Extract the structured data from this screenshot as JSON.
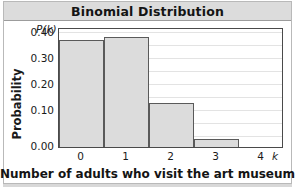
{
  "title": "Binomial Distribution",
  "chart_data": {
    "type": "bar",
    "title": "Binomial Distribution",
    "subtitle": "",
    "xlabel": "Number of adults who visit the art museum",
    "ylabel": "Probability",
    "x_variable_symbol": "k",
    "y_variable_symbol": "P(k)",
    "categories": [
      "0",
      "1",
      "2",
      "3",
      "4"
    ],
    "values": [
      0.41,
      0.42,
      0.17,
      0.03,
      0.0
    ],
    "xlim": [
      -0.5,
      4.5
    ],
    "ylim": [
      0,
      0.46
    ],
    "yticks": [
      "0.40",
      "0.30",
      "0.20",
      "0.10",
      "0.00"
    ],
    "ytick_values": [
      0.4,
      0.3,
      0.2,
      0.1,
      0.0
    ],
    "xticks": [
      "0",
      "1",
      "2",
      "3",
      "4"
    ],
    "grid": true,
    "grid_axis": "y",
    "minor_grid_step": 0.05,
    "legend": "none",
    "bar_fill_color": "#dcdcdc",
    "bar_edge_color": "#5a5a5a",
    "grid_color": "#e3e3e3",
    "axis_color": "#4a4a4a"
  },
  "colors": {
    "title_bar_bg": "#dcdcdc",
    "page_bg": "#ffffff",
    "frame": "#b9b9b9",
    "text": "#1a1a1a"
  }
}
